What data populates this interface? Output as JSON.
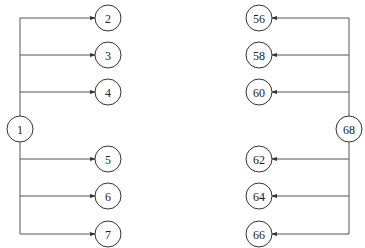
{
  "diagram": {
    "left_tree": {
      "root": {
        "label": "1",
        "x": 20,
        "y": 129
      },
      "trunk_x": 20,
      "trunk_top": 18,
      "trunk_bottom": 234,
      "children": [
        {
          "label": "2",
          "x": 108,
          "y": 18
        },
        {
          "label": "3",
          "x": 108,
          "y": 55
        },
        {
          "label": "4",
          "x": 108,
          "y": 92
        },
        {
          "label": "5",
          "x": 108,
          "y": 159
        },
        {
          "label": "6",
          "x": 108,
          "y": 196
        },
        {
          "label": "7",
          "x": 108,
          "y": 234
        }
      ]
    },
    "right_tree": {
      "root": {
        "label": "68",
        "x": 349,
        "y": 129
      },
      "trunk_x": 349,
      "trunk_top": 18,
      "trunk_bottom": 234,
      "children": [
        {
          "label": "56",
          "x": 259,
          "y": 18
        },
        {
          "label": "58",
          "x": 259,
          "y": 55
        },
        {
          "label": "60",
          "x": 259,
          "y": 92
        },
        {
          "label": "62",
          "x": 259,
          "y": 159
        },
        {
          "label": "64",
          "x": 259,
          "y": 196
        },
        {
          "label": "66",
          "x": 259,
          "y": 234
        }
      ]
    },
    "node_radius": 13,
    "colors": {
      "line": "#555555",
      "node_stroke": "#333333",
      "text": "#222222",
      "background": "#ffffff"
    }
  }
}
